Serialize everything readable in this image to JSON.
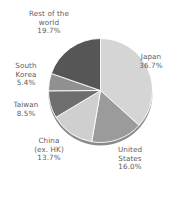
{
  "chart_data": {
    "type": "pie",
    "title": "",
    "subtitle": "",
    "xlabel": "",
    "ylabel": "",
    "legend_position": "none",
    "grid": false,
    "labels_outside": true,
    "start_angle_deg": 0,
    "direction": "clockwise",
    "categories": [
      "Japan",
      "United States",
      "China (ex. HK)",
      "Taiwan",
      "South Korea",
      "Rest of the world"
    ],
    "values": [
      36.7,
      16.0,
      13.7,
      8.5,
      5.4,
      19.7
    ],
    "unit": "%",
    "total": 100.0,
    "slices": [
      {
        "name": "Japan",
        "name_line1": "Japan",
        "name_line2": "",
        "value": 36.7,
        "value_label": "36.7%",
        "color": "#d5d5d5"
      },
      {
        "name": "United States",
        "name_line1": "United",
        "name_line2": "States",
        "value": 16.0,
        "value_label": "16.0%",
        "color": "#9b9b9b"
      },
      {
        "name": "China (ex. HK)",
        "name_line1": "China",
        "name_line2": "(ex. HK)",
        "value": 13.7,
        "value_label": "13.7%",
        "color": "#cfcfcf"
      },
      {
        "name": "Taiwan",
        "name_line1": "Taiwan",
        "name_line2": "",
        "value": 8.5,
        "value_label": "8.5%",
        "color": "#6e6e6e"
      },
      {
        "name": "South Korea",
        "name_line1": "South",
        "name_line2": "Korea",
        "value": 5.4,
        "value_label": "5.4%",
        "color": "#909090"
      },
      {
        "name": "Rest of the world",
        "name_line1": "Rest of the",
        "name_line2": "world",
        "value": 19.7,
        "value_label": "19.7%",
        "color": "#565656"
      }
    ],
    "colors": {
      "background": "#ffffff",
      "label_text": "#5c5c5c",
      "slice_border": "#ffffff",
      "shadow": "#8a8a8a"
    }
  }
}
